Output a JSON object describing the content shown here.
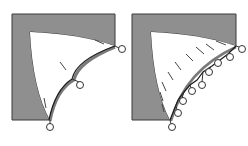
{
  "colors": {
    "frame_fill": "#8f8f8f",
    "frame_stroke": "#3a3a3a",
    "region_fill": "#ffffff",
    "curve_stroke": "#1a1a1a",
    "curve_shadow": "#7a7a7a",
    "node_stroke": "#333333",
    "dash_stroke": "#444444"
  },
  "panels": [
    {
      "id": "left",
      "description": "Coarse approximation with 3 control points",
      "node_count": 3
    },
    {
      "id": "right",
      "description": "Fine approximation with 9 control points",
      "node_count": 9
    }
  ]
}
